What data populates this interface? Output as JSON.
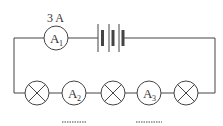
{
  "diagram": {
    "type": "circuit",
    "stroke_color": "#444444",
    "labels": {
      "a1_reading": "3 A",
      "a1": "A",
      "a1_sub": "1",
      "a2": "A",
      "a2_sub": "2",
      "a3": "A",
      "a3_sub": "3",
      "a2_blank": "........",
      "a3_blank": "........"
    },
    "components": [
      {
        "id": "A1",
        "kind": "ammeter",
        "reading": "3 A"
      },
      {
        "id": "battery",
        "kind": "battery",
        "cells": 3
      },
      {
        "id": "L1",
        "kind": "lamp"
      },
      {
        "id": "A2",
        "kind": "ammeter",
        "reading": "........"
      },
      {
        "id": "L2",
        "kind": "lamp"
      },
      {
        "id": "A3",
        "kind": "ammeter",
        "reading": "........"
      },
      {
        "id": "L3",
        "kind": "lamp"
      }
    ]
  }
}
